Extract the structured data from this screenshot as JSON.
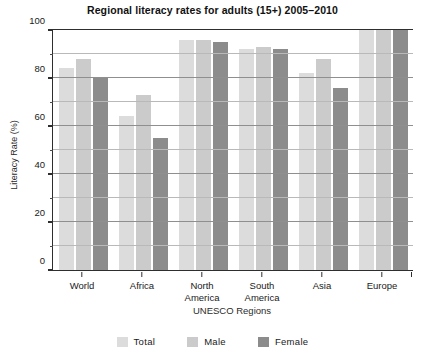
{
  "chart_data": {
    "type": "bar",
    "title": "Regional literacy rates for adults (15+) 2005–2010",
    "xlabel": "UNESCO Regions",
    "ylabel": "Literacy Rate (%)",
    "categories": [
      "World",
      "Africa",
      "North America",
      "South America",
      "Asia",
      "Europe"
    ],
    "series": [
      {
        "name": "Total",
        "color": "#dcdcdc",
        "values": [
          84,
          64,
          96,
          92,
          82,
          100
        ]
      },
      {
        "name": "Male",
        "color": "#cbcbcb",
        "values": [
          88,
          73,
          96,
          93,
          88,
          100
        ]
      },
      {
        "name": "Female",
        "color": "#8c8c8c",
        "values": [
          80,
          55,
          95,
          92,
          76,
          100
        ]
      }
    ],
    "ylim": [
      0,
      100
    ],
    "yticks": [
      0,
      20,
      40,
      60,
      80,
      100
    ],
    "yticks_minor": [
      10,
      30,
      50,
      70,
      90
    ],
    "ytick_labels": [
      "0",
      "20",
      "40",
      "60",
      "80",
      "100"
    ],
    "grid": true,
    "legend_position": "bottom"
  },
  "legend": {
    "items": [
      {
        "label": "Total",
        "color": "#dcdcdc"
      },
      {
        "label": "Male",
        "color": "#cbcbcb"
      },
      {
        "label": "Female",
        "color": "#8c8c8c"
      }
    ]
  },
  "xtick_lines": [
    [
      "World"
    ],
    [
      "Africa"
    ],
    [
      "North",
      "America"
    ],
    [
      "South",
      "America"
    ],
    [
      "Asia"
    ],
    [
      "Europe"
    ]
  ]
}
